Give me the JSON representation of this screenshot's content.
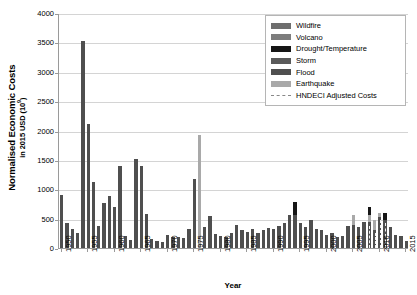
{
  "chart_data": {
    "type": "bar",
    "stacked": true,
    "title": "",
    "xlabel": "Year",
    "ylabel": "Normalised Economic Costs",
    "ylabel_sub": "in 2015 USD (10⁹)",
    "ylim": [
      0,
      4000
    ],
    "ytick_step": 500,
    "ytick_labels": [
      "0",
      "500",
      "1000",
      "1500",
      "2000",
      "2500",
      "3000",
      "3500",
      "4000"
    ],
    "xlim": [
      1949.5,
      2015.5
    ],
    "xtick_labels": [
      "1950",
      "1955",
      "1960",
      "1965",
      "1970",
      "1975",
      "1980",
      "1985",
      "1990",
      "1995",
      "2000",
      "2005",
      "2010",
      "2015"
    ],
    "grid": "horizontal",
    "legend_position": "top-right",
    "series": [
      {
        "name": "Wildfire",
        "color": "#6e6e6e"
      },
      {
        "name": "Volcano",
        "color": "#7d7d7d"
      },
      {
        "name": "Drought/Temperature",
        "color": "#161616"
      },
      {
        "name": "Storm",
        "color": "#5a5a5a"
      },
      {
        "name": "Flood",
        "color": "#4f4f4f"
      },
      {
        "name": "Earthquake",
        "color": "#a9a9a9"
      }
    ],
    "line_series": [
      {
        "name": "HNDECI Adjusted Costs",
        "style": "dashed",
        "color": "#9a9a9a"
      }
    ],
    "categories": [
      1950,
      1951,
      1952,
      1953,
      1954,
      1955,
      1956,
      1957,
      1958,
      1959,
      1960,
      1961,
      1962,
      1963,
      1964,
      1965,
      1966,
      1967,
      1968,
      1969,
      1970,
      1971,
      1972,
      1973,
      1974,
      1975,
      1976,
      1977,
      1978,
      1979,
      1980,
      1981,
      1982,
      1983,
      1984,
      1985,
      1986,
      1987,
      1988,
      1989,
      1990,
      1991,
      1992,
      1993,
      1994,
      1995,
      1996,
      1997,
      1998,
      1999,
      2000,
      2001,
      2002,
      2003,
      2004,
      2005,
      2006,
      2007,
      2008,
      2009,
      2010,
      2011,
      2012,
      2013,
      2014,
      2015
    ],
    "values": {
      "Wildfire": [
        0,
        0,
        0,
        0,
        0,
        0,
        0,
        0,
        0,
        0,
        0,
        0,
        0,
        0,
        0,
        0,
        0,
        0,
        0,
        0,
        0,
        0,
        0,
        0,
        0,
        0,
        0,
        0,
        0,
        0,
        0,
        0,
        0,
        0,
        0,
        0,
        0,
        0,
        0,
        0,
        0,
        0,
        0,
        0,
        0,
        0,
        0,
        0,
        0,
        0,
        0,
        0,
        0,
        0,
        0,
        0,
        0,
        0,
        0,
        0,
        0,
        0,
        0,
        0,
        0,
        0
      ],
      "Volcano": [
        0,
        0,
        0,
        0,
        0,
        0,
        0,
        0,
        0,
        0,
        0,
        0,
        0,
        0,
        0,
        0,
        0,
        0,
        0,
        0,
        0,
        0,
        0,
        0,
        0,
        0,
        0,
        0,
        0,
        0,
        0,
        0,
        0,
        0,
        0,
        0,
        0,
        0,
        0,
        0,
        0,
        0,
        0,
        0,
        0,
        0,
        0,
        0,
        0,
        0,
        0,
        0,
        0,
        0,
        0,
        0,
        0,
        0,
        0,
        0,
        0,
        0,
        0,
        0,
        0,
        0
      ],
      "Drought/Temperature": [
        0,
        0,
        0,
        0,
        0,
        0,
        0,
        0,
        0,
        0,
        0,
        0,
        0,
        0,
        0,
        0,
        0,
        0,
        0,
        0,
        0,
        0,
        0,
        0,
        0,
        0,
        0,
        0,
        0,
        0,
        0,
        0,
        0,
        0,
        0,
        0,
        0,
        0,
        0,
        0,
        0,
        0,
        0,
        0,
        230,
        0,
        0,
        0,
        0,
        0,
        0,
        0,
        0,
        0,
        0,
        0,
        0,
        0,
        130,
        0,
        0,
        120,
        0,
        0,
        0,
        0
      ],
      "Storm": [
        0,
        0,
        0,
        0,
        0,
        0,
        0,
        0,
        0,
        0,
        0,
        0,
        0,
        0,
        0,
        0,
        0,
        0,
        0,
        0,
        0,
        0,
        0,
        0,
        0,
        0,
        0,
        0,
        0,
        0,
        0,
        0,
        0,
        0,
        0,
        0,
        0,
        0,
        0,
        0,
        0,
        0,
        0,
        0,
        0,
        0,
        0,
        0,
        0,
        0,
        0,
        0,
        0,
        0,
        0,
        0,
        0,
        0,
        0,
        0,
        0,
        0,
        0,
        0,
        0,
        0
      ],
      "Flood": [
        900,
        420,
        330,
        250,
        3520,
        2110,
        1130,
        380,
        770,
        880,
        700,
        1400,
        200,
        130,
        1520,
        1400,
        580,
        150,
        120,
        110,
        230,
        180,
        190,
        170,
        330,
        1180,
        0,
        360,
        540,
        240,
        200,
        180,
        250,
        400,
        300,
        270,
        320,
        260,
        300,
        340,
        330,
        380,
        430,
        560,
        560,
        430,
        360,
        480,
        330,
        300,
        230,
        260,
        180,
        210,
        380,
        400,
        360,
        440,
        440,
        300,
        520,
        480,
        350,
        220,
        200,
        120
      ],
      "Earthquake": [
        0,
        0,
        0,
        0,
        0,
        0,
        0,
        0,
        0,
        0,
        0,
        0,
        0,
        0,
        0,
        0,
        0,
        0,
        0,
        0,
        0,
        0,
        0,
        0,
        0,
        0,
        1930,
        0,
        0,
        0,
        0,
        0,
        0,
        0,
        0,
        0,
        0,
        0,
        0,
        0,
        0,
        0,
        0,
        0,
        0,
        0,
        0,
        0,
        0,
        0,
        0,
        0,
        0,
        0,
        0,
        170,
        0,
        0,
        120,
        180,
        80,
        0,
        0,
        0,
        0,
        0
      ]
    },
    "hndeci_years": [
      2008,
      2009,
      2010,
      2011
    ],
    "hndeci_values": [
      380,
      260,
      470,
      430
    ]
  },
  "legend": {
    "entries": [
      {
        "label": "Wildfire"
      },
      {
        "label": "Volcano"
      },
      {
        "label": "Drought/Temperature"
      },
      {
        "label": "Storm"
      },
      {
        "label": "Flood"
      },
      {
        "label": "Earthquake"
      },
      {
        "label": "HNDECI Adjusted Costs"
      }
    ]
  }
}
